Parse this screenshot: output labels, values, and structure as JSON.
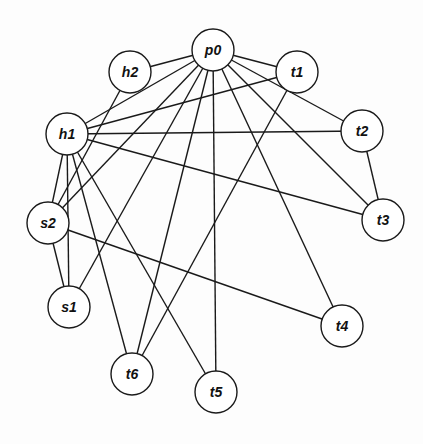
{
  "graph": {
    "radius": 21,
    "colors": {
      "stroke": "#1a1a1a",
      "fill": "#ffffff",
      "label": "#111111"
    },
    "nodes": [
      {
        "id": "p0",
        "label": "p0",
        "x": 213,
        "y": 50
      },
      {
        "id": "t1",
        "label": "t1",
        "x": 297,
        "y": 72
      },
      {
        "id": "h2",
        "label": "h2",
        "x": 130,
        "y": 72
      },
      {
        "id": "h1",
        "label": "h1",
        "x": 67,
        "y": 134
      },
      {
        "id": "t2",
        "label": "t2",
        "x": 362,
        "y": 131
      },
      {
        "id": "s2",
        "label": "s2",
        "x": 48,
        "y": 223
      },
      {
        "id": "t3",
        "label": "t3",
        "x": 383,
        "y": 220
      },
      {
        "id": "s1",
        "label": "s1",
        "x": 69,
        "y": 307
      },
      {
        "id": "t4",
        "label": "t4",
        "x": 342,
        "y": 326
      },
      {
        "id": "t6",
        "label": "t6",
        "x": 132,
        "y": 374
      },
      {
        "id": "t5",
        "label": "t5",
        "x": 216,
        "y": 392
      }
    ],
    "edges": [
      [
        "p0",
        "h2"
      ],
      [
        "p0",
        "h1"
      ],
      [
        "p0",
        "s2"
      ],
      [
        "p0",
        "s1"
      ],
      [
        "p0",
        "t6"
      ],
      [
        "p0",
        "t5"
      ],
      [
        "p0",
        "t4"
      ],
      [
        "p0",
        "t3"
      ],
      [
        "p0",
        "t2"
      ],
      [
        "p0",
        "t1"
      ],
      [
        "h1",
        "t1"
      ],
      [
        "h1",
        "t2"
      ],
      [
        "h1",
        "t3"
      ],
      [
        "h1",
        "s2"
      ],
      [
        "h1",
        "s1"
      ],
      [
        "h1",
        "t6"
      ],
      [
        "h1",
        "t5"
      ],
      [
        "h2",
        "s2"
      ],
      [
        "t1",
        "t6"
      ],
      [
        "t2",
        "t3"
      ],
      [
        "s2",
        "s1"
      ],
      [
        "s2",
        "t4"
      ]
    ]
  }
}
